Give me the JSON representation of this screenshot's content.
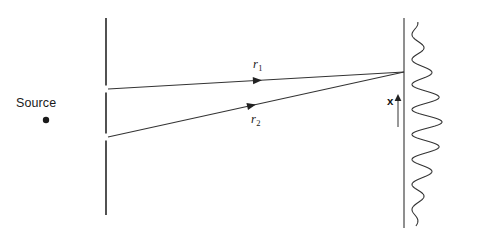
{
  "figure": {
    "background_color": "#ffffff",
    "stroke_color": "#333333",
    "text_color": "#1a1a1a"
  },
  "source": {
    "label": "Source",
    "dot_x": 46,
    "dot_y": 120,
    "label_x": 16,
    "label_y": 96
  },
  "barrier": {
    "name": "double-slit-barrier",
    "x": 106,
    "top": 18,
    "bottom": 215,
    "slits": [
      {
        "name": "upper-slit",
        "center_y": 89,
        "gap": 7
      },
      {
        "name": "lower-slit",
        "center_y": 137,
        "gap": 7
      }
    ]
  },
  "screen": {
    "name": "observation-screen",
    "x": 404,
    "top": 18,
    "bottom": 228
  },
  "rays": [
    {
      "name": "ray-r1",
      "label": "r",
      "subscript": "1",
      "start_x": 108,
      "start_y": 89,
      "end_x": 404,
      "end_y": 72,
      "arrow_t": 0.52,
      "label_x": 253,
      "label_y": 57
    },
    {
      "name": "ray-r2",
      "label": "r",
      "subscript": "2",
      "start_x": 108,
      "start_y": 137,
      "end_x": 404,
      "end_y": 72,
      "arrow_t": 0.5,
      "label_x": 251,
      "label_y": 112
    }
  ],
  "axis": {
    "name": "x-axis-indicator",
    "label": "x",
    "label_x": 387,
    "label_y": 95,
    "arrow_x": 398,
    "arrow_base_y": 127,
    "arrow_tip_y": 94
  },
  "chart_data": {
    "type": "line",
    "orientation": "vertical",
    "xlabel": "Intensity",
    "ylabel": "x (position on screen)",
    "grid": false,
    "legend": null,
    "baseline_x": 412,
    "center_y": 122,
    "period": 25.0,
    "envelope_sigma": 78,
    "max_amplitude": 30,
    "y_range": [
      22,
      226
    ],
    "fringes": [
      {
        "x": 26,
        "amplitude": 5
      },
      {
        "x": 51,
        "amplitude": 10
      },
      {
        "x": 76,
        "amplitude": 17
      },
      {
        "x": 101,
        "amplitude": 25
      },
      {
        "x": 122,
        "amplitude": 30
      },
      {
        "x": 147,
        "amplitude": 27
      },
      {
        "x": 172,
        "amplitude": 19
      },
      {
        "x": 197,
        "amplitude": 11
      },
      {
        "x": 220,
        "amplitude": 5
      }
    ]
  }
}
